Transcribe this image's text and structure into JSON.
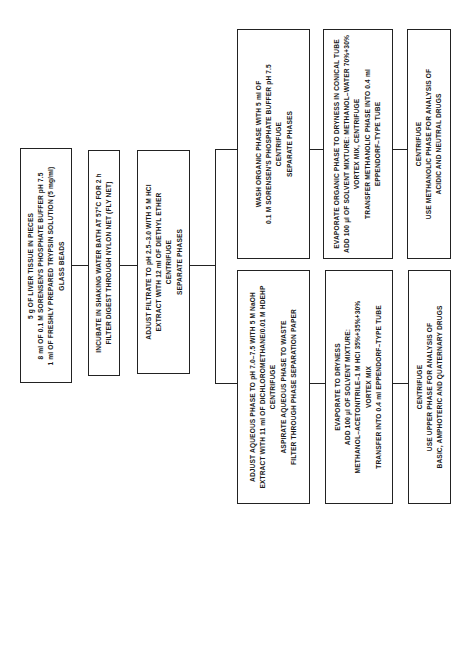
{
  "flowchart": {
    "steps": {
      "sample": {
        "lines": [
          "5 g OF LIVER TISSUE IN PIECES",
          "8 ml OF 0.1 M SORENSEN'S PHOSPHATE BUFFER pH 7.5",
          "1 ml OF FRESHLY PREPARED TRYPSIN SOLUTION (5 mg/ml)",
          "GLASS BEADS"
        ]
      },
      "incubate": {
        "lines": [
          "INCUBATE IN SHAKING WATER BATH AT 57°C FOR 2 h",
          "FILTER DIGEST THROUGH NYLON NET (FLY NET)"
        ]
      },
      "adjust_filtrate": {
        "lines": [
          "ADJUST FILTRATE TO pH 2.5–3.0 WITH 5 M HCl",
          "EXTRACT WITH 12 ml OF DIETHYL ETHER",
          "CENTRIFUGE",
          "SEPARATE PHASES"
        ]
      },
      "organic_wash": {
        "lines": [
          "WASH ORGANIC PHASE WITH 5 ml OF",
          "0.1 M SORENSEN'S PHOSPHATE BUFFER pH 7.5",
          "CENTRIFUGE",
          "SEPARATE PHASES"
        ]
      },
      "organic_evaporate": {
        "lines": [
          "EVAPORATE ORGANIC PHASE TO DRYNESS IN CONICAL TUBE",
          "ADD 100 µl OF SOLVENT MIXTURE: METHANOL–WATER 70%+30%",
          "VORTEX MIX, CENTRIFUGE",
          "TRANSFER METHANOLIC PHASE INTO 0.4 ml",
          "EPPENDORF–TYPE TUBE"
        ]
      },
      "organic_centrifuge": {
        "lines": [
          "CENTRIFUGE",
          "USE METHANOLIC PHASE FOR ANALYSIS OF",
          "ACIDIC AND NEUTRAL DRUGS"
        ]
      },
      "aqueous_adjust": {
        "lines": [
          "ADJUST AQUEOUS PHASE TO pH 7.0–7.5 WITH 5 M NaOH",
          "EXTRACT WITH 11 ml OF DICHLOROMETHANE/0.01 M HDEHP",
          "CENTRIFUGE",
          "ASPIRATE AQUEOUS PHASE TO WASTE",
          "FILTER THROUGH PHASE SEPARATION PAPER"
        ]
      },
      "aqueous_evaporate": {
        "lines": [
          "EVAPORATE TO DRYNESS",
          "ADD 100 µl OF SOLVENT MIXTURE:",
          "METHANOL–ACETONITRILE–1 M HCl 35%+35%+30%",
          "VORTEX MIX",
          "TRANSFER INTO 0.4 ml EPPENDORF–TYPE TUBE"
        ]
      },
      "aqueous_centrifuge": {
        "lines": [
          "CENTRIFUGE",
          "USE UPPER PHASE FOR ANALYSIS OF",
          "BASIC, AMPHOTERIC AND QUATERNARY DRUGS"
        ]
      }
    }
  }
}
